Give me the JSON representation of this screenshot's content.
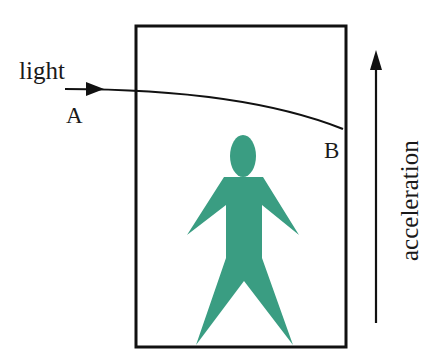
{
  "diagram": {
    "labels": {
      "light": "light",
      "point_a": "A",
      "point_b": "B",
      "acceleration": "acceleration"
    },
    "colors": {
      "figure": "#3a9d82",
      "line": "#111111",
      "background": "#ffffff"
    },
    "elements": {
      "box": "elevator-box",
      "figure": "person-figure",
      "light_path": "curved-light-ray",
      "acceleration_arrow": "upward-arrow"
    }
  }
}
